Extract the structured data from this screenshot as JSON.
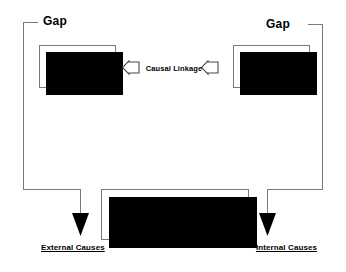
{
  "diagram": {
    "type": "flow-diagram",
    "background_color": "#ffffff",
    "line_color": "#7a7a7a",
    "shadow_color": "#000000",
    "text_color": "#000000"
  },
  "labels": {
    "gap_left": "Gap",
    "gap_right": "Gap",
    "causal_linkage": "Causal Linkage",
    "cause_external": "External Causes",
    "cause_internal": "Internal Causes"
  },
  "nodes": {
    "is_4": {
      "label": "4.  Is",
      "number": "4.",
      "name": "Is"
    },
    "is_3": {
      "label": "3.  Is",
      "number": "3.",
      "name": "Is"
    },
    "environmental": {
      "line1": "5.  Environmental Factors",
      "line2": "Impacting Performance",
      "number": "5.",
      "name": "Environmental Factors Impacting Performance"
    }
  },
  "icons": {
    "chevron_left_outer": "chevron-left-icon",
    "chevron_left_inner": "chevron-left-icon",
    "arrow_down_left": "arrow-down-icon",
    "arrow_down_right": "arrow-down-icon"
  }
}
